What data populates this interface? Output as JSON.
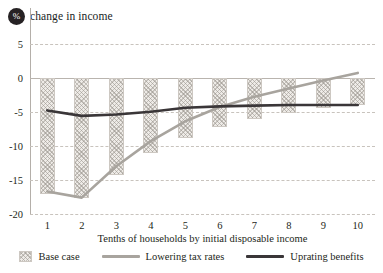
{
  "title": {
    "badge": "%",
    "text": "change in income"
  },
  "chart_data": {
    "type": "bar",
    "title": "% change in income",
    "xlabel": "Tenths of households by initial disposable income",
    "ylabel": "% change in income",
    "categories": [
      "1",
      "2",
      "3",
      "4",
      "5",
      "6",
      "7",
      "8",
      "9",
      "10"
    ],
    "ylim": [
      -20,
      7
    ],
    "yticks": [
      5,
      0,
      -5,
      -10,
      -15,
      -20
    ],
    "ytick_labels": [
      "5",
      "0",
      "-5",
      "-10",
      "-15",
      "-20"
    ],
    "grid": true,
    "legend_position": "bottom",
    "series": [
      {
        "name": "Base case",
        "type": "bar",
        "color": "#d6d1cb",
        "pattern": "cross-hatch",
        "values": [
          -17.0,
          -17.7,
          -14.3,
          -11.0,
          -8.9,
          -7.2,
          -6.0,
          -5.2,
          -4.5,
          -4.0
        ]
      },
      {
        "name": "Lowering tax rates",
        "type": "line",
        "color": "#a8a49e",
        "values": [
          -16.7,
          -17.6,
          -13.0,
          -9.3,
          -6.4,
          -4.3,
          -2.8,
          -1.6,
          -0.4,
          0.7
        ]
      },
      {
        "name": "Uprating benefits",
        "type": "line",
        "color": "#3a3638",
        "values": [
          -4.8,
          -5.6,
          -5.4,
          -5.0,
          -4.4,
          -4.2,
          -4.1,
          -4.0,
          -4.0,
          -4.0
        ]
      }
    ]
  },
  "axis": {
    "x_title": "Tenths of households by initial disposable income"
  },
  "legend": {
    "items": [
      {
        "label": "Base case",
        "marker": "hatched-swatch",
        "color": "#d6d1cb"
      },
      {
        "label": "Lowering tax rates",
        "marker": "line",
        "color": "#a8a49e"
      },
      {
        "label": "Uprating benefits",
        "marker": "line",
        "color": "#3a3638"
      }
    ]
  }
}
